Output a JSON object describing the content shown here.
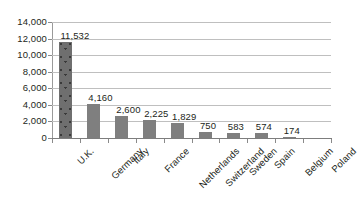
{
  "chart_data": {
    "type": "bar",
    "title": "",
    "subtitle": "",
    "xlabel": "",
    "ylabel": "",
    "ylim": [
      0,
      14000
    ],
    "ytick_labels": [
      "0",
      "2,000",
      "4,000",
      "6,000",
      "8,000",
      "10,000",
      "12,000",
      "14,000"
    ],
    "ytick_values": [
      0,
      2000,
      4000,
      6000,
      8000,
      10000,
      12000,
      14000
    ],
    "grid": true,
    "legend": false,
    "legend_position": "none",
    "orientation": "vertical",
    "categories": [
      "U.K.",
      "Germany",
      "Italy",
      "France",
      "Netherlands",
      "Switzerland",
      "Sweden",
      "Spain",
      "Belgium",
      "Poland"
    ],
    "values": [
      11532,
      4160,
      2600,
      2225,
      1829,
      750,
      583,
      574,
      174,
      0
    ],
    "data_labels": [
      "11,532",
      "4,160",
      "2,600",
      "2,225",
      "1,829",
      "750",
      "583",
      "574",
      "174",
      ""
    ],
    "bar_color": "#7f7f7f",
    "highlight_bar_color": "#6f6f6f",
    "gridline_color": "#bfbfbf",
    "axis_color": "#8a8a8a",
    "text_color": "#231f20",
    "background_color": "#ffffff",
    "points": [
      {
        "category": "U.K.",
        "value": 11532,
        "label": "11,532"
      },
      {
        "category": "Germany",
        "value": 4160,
        "label": "4,160"
      },
      {
        "category": "Italy",
        "value": 2600,
        "label": "2,600"
      },
      {
        "category": "France",
        "value": 2225,
        "label": "2,225"
      },
      {
        "category": "Netherlands",
        "value": 1829,
        "label": "1,829"
      },
      {
        "category": "Switzerland",
        "value": 750,
        "label": "750"
      },
      {
        "category": "Sweden",
        "value": 583,
        "label": "583"
      },
      {
        "category": "Spain",
        "value": 574,
        "label": "574"
      },
      {
        "category": "Belgium",
        "value": 174,
        "label": "174"
      },
      {
        "category": "Poland",
        "value": 0,
        "label": ""
      }
    ]
  }
}
